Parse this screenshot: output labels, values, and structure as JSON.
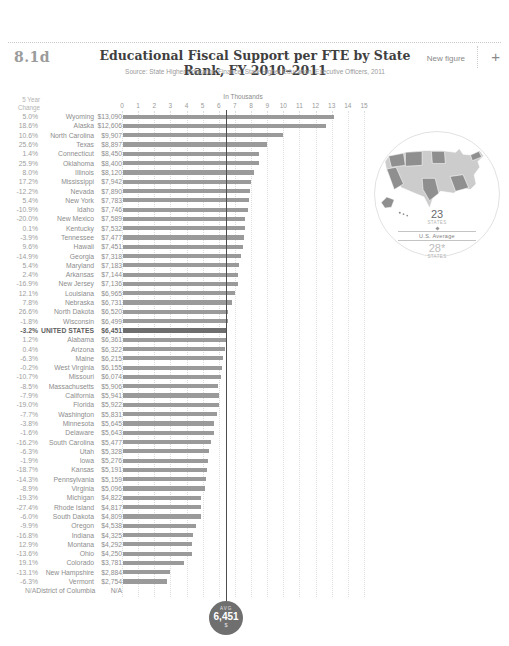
{
  "header": {
    "figure_number": "8.1d",
    "title": "Educational Fiscal Support per FTE by State Rank, FY 2010–2011",
    "source": "Source: State Higher Education Finance, State Higher Education, Executive Officers, 2011",
    "new_figure_label": "New figure",
    "add_icon": "+"
  },
  "left_column_header_line1": "5 Year",
  "left_column_header_line2": "Change",
  "axis": {
    "title": "In Thousands",
    "ticks": [
      0,
      1,
      2,
      3,
      4,
      5,
      6,
      7,
      8,
      9,
      10,
      11,
      12,
      13,
      14,
      15
    ]
  },
  "rows": [
    {
      "pct": "5.0%",
      "state": "Wyoming",
      "value": "$13,090"
    },
    {
      "pct": "18.6%",
      "state": "Alaska",
      "value": "$12,606"
    },
    {
      "pct": "10.6%",
      "state": "North Carolina",
      "value": "$9,907"
    },
    {
      "pct": "25.6%",
      "state": "Texas",
      "value": "$8,897"
    },
    {
      "pct": "1.4%",
      "state": "Connecticut",
      "value": "$8,450"
    },
    {
      "pct": "25.9%",
      "state": "Oklahoma",
      "value": "$8,400"
    },
    {
      "pct": "8.0%",
      "state": "Illinois",
      "value": "$8,120"
    },
    {
      "pct": "17.2%",
      "state": "Mississippi",
      "value": "$7,942"
    },
    {
      "pct": "-12.2%",
      "state": "Nevada",
      "value": "$7,890"
    },
    {
      "pct": "5.4%",
      "state": "New York",
      "value": "$7,783"
    },
    {
      "pct": "-10.9%",
      "state": "Idaho",
      "value": "$7,746"
    },
    {
      "pct": "-20.0%",
      "state": "New Mexico",
      "value": "$7,589"
    },
    {
      "pct": "0.1%",
      "state": "Kentucky",
      "value": "$7,532"
    },
    {
      "pct": "-3.9%",
      "state": "Tennessee",
      "value": "$7,477"
    },
    {
      "pct": "9.6%",
      "state": "Hawaii",
      "value": "$7,451"
    },
    {
      "pct": "-14.9%",
      "state": "Georgia",
      "value": "$7,318"
    },
    {
      "pct": "5.4%",
      "state": "Maryland",
      "value": "$7,183"
    },
    {
      "pct": "2.4%",
      "state": "Arkansas",
      "value": "$7,144"
    },
    {
      "pct": "-16.9%",
      "state": "New Jersey",
      "value": "$7,136"
    },
    {
      "pct": "12.1%",
      "state": "Louisiana",
      "value": "$6,965"
    },
    {
      "pct": "7.8%",
      "state": "Nebraska",
      "value": "$6,731"
    },
    {
      "pct": "26.6%",
      "state": "North Dakota",
      "value": "$6,520"
    },
    {
      "pct": "-1.8%",
      "state": "Wisconsin",
      "value": "$6,499"
    },
    {
      "pct": "-3.2%",
      "state": "UNITED STATES",
      "value": "$6,451"
    },
    {
      "pct": "1.2%",
      "state": "Alabama",
      "value": "$6,361"
    },
    {
      "pct": "0.4%",
      "state": "Arizona",
      "value": "$6,322"
    },
    {
      "pct": "-6.3%",
      "state": "Maine",
      "value": "$6,215"
    },
    {
      "pct": "-0.2%",
      "state": "West Virginia",
      "value": "$6,155"
    },
    {
      "pct": "-10.7%",
      "state": "Missouri",
      "value": "$6,074"
    },
    {
      "pct": "-8.5%",
      "state": "Massachusetts",
      "value": "$5,906"
    },
    {
      "pct": "-7.9%",
      "state": "California",
      "value": "$5,941"
    },
    {
      "pct": "-19.0%",
      "state": "Florida",
      "value": "$5,922"
    },
    {
      "pct": "-7.7%",
      "state": "Washington",
      "value": "$5,831"
    },
    {
      "pct": "-3.8%",
      "state": "Minnesota",
      "value": "$5,645"
    },
    {
      "pct": "-1.6%",
      "state": "Delaware",
      "value": "$5,643"
    },
    {
      "pct": "-16.2%",
      "state": "South Carolina",
      "value": "$5,477"
    },
    {
      "pct": "-6.3%",
      "state": "Utah",
      "value": "$5,328"
    },
    {
      "pct": "-1.9%",
      "state": "Iowa",
      "value": "$5,276"
    },
    {
      "pct": "-18.7%",
      "state": "Kansas",
      "value": "$5,191"
    },
    {
      "pct": "-14.3%",
      "state": "Pennsylvania",
      "value": "$5,159"
    },
    {
      "pct": "-8.9%",
      "state": "Virginia",
      "value": "$5,096"
    },
    {
      "pct": "-19.3%",
      "state": "Michigan",
      "value": "$4,822"
    },
    {
      "pct": "-27.4%",
      "state": "Rhode Island",
      "value": "$4,817"
    },
    {
      "pct": "-6.0%",
      "state": "South Dakota",
      "value": "$4,809"
    },
    {
      "pct": "-9.9%",
      "state": "Oregon",
      "value": "$4,538"
    },
    {
      "pct": "-16.8%",
      "state": "Indiana",
      "value": "$4,325"
    },
    {
      "pct": "12.9%",
      "state": "Montana",
      "value": "$4,292"
    },
    {
      "pct": "-13.6%",
      "state": "Ohio",
      "value": "$4,250"
    },
    {
      "pct": "19.1%",
      "state": "Colorado",
      "value": "$3,781"
    },
    {
      "pct": "-13.1%",
      "state": "New Hampshire",
      "value": "$2,884"
    },
    {
      "pct": "-6.3%",
      "state": "Vermont",
      "value": "$2,754"
    },
    {
      "pct": "N/A",
      "state": "District of Columbia",
      "value": "N/A"
    }
  ],
  "us_average": {
    "value": 6451,
    "badge_label": "AVG",
    "badge_value": "6,451",
    "badge_unit": "$"
  },
  "map_panel": {
    "above_count": "23",
    "above_label": "States",
    "divider_label": "U.S. Average",
    "below_count": "28*",
    "below_label": "States"
  },
  "colors": {
    "bar": "#9a9a9a",
    "bar-emphasis": "#6e6e6e",
    "avg-line": "#4d4d4d",
    "badge-bg": "#6f6f6f",
    "map-dark": "#8f8f8f",
    "map-light": "#cccccc"
  },
  "chart_data": {
    "type": "bar",
    "orientation": "horizontal",
    "title": "Educational Fiscal Support per FTE by State Rank, FY 2010–2011",
    "xlabel": "In Thousands",
    "ylabel": "State",
    "xlim_thousands": [
      0,
      15
    ],
    "grid": "dotted-vertical",
    "emphasis_row": "UNITED STATES",
    "categories": [
      "Wyoming",
      "Alaska",
      "North Carolina",
      "Texas",
      "Connecticut",
      "Oklahoma",
      "Illinois",
      "Mississippi",
      "Nevada",
      "New York",
      "Idaho",
      "New Mexico",
      "Kentucky",
      "Tennessee",
      "Hawaii",
      "Georgia",
      "Maryland",
      "Arkansas",
      "New Jersey",
      "Louisiana",
      "Nebraska",
      "North Dakota",
      "Wisconsin",
      "UNITED STATES",
      "Alabama",
      "Arizona",
      "Maine",
      "West Virginia",
      "Missouri",
      "Massachusetts",
      "California",
      "Florida",
      "Washington",
      "Minnesota",
      "Delaware",
      "South Carolina",
      "Utah",
      "Iowa",
      "Kansas",
      "Pennsylvania",
      "Virginia",
      "Michigan",
      "Rhode Island",
      "South Dakota",
      "Oregon",
      "Indiana",
      "Montana",
      "Ohio",
      "Colorado",
      "New Hampshire",
      "Vermont",
      "District of Columbia"
    ],
    "values": [
      13090,
      12606,
      9907,
      8897,
      8450,
      8400,
      8120,
      7942,
      7890,
      7783,
      7746,
      7589,
      7532,
      7477,
      7451,
      7318,
      7183,
      7144,
      7136,
      6965,
      6731,
      6520,
      6499,
      6451,
      6361,
      6322,
      6215,
      6155,
      6074,
      5906,
      5941,
      5922,
      5831,
      5645,
      5643,
      5477,
      5328,
      5276,
      5191,
      5159,
      5096,
      4822,
      4817,
      4809,
      4538,
      4325,
      4292,
      4250,
      3781,
      2884,
      2754,
      null
    ],
    "pct_change_5yr": [
      "5.0%",
      "18.6%",
      "10.6%",
      "25.6%",
      "1.4%",
      "25.9%",
      "8.0%",
      "17.2%",
      "-12.2%",
      "5.4%",
      "-10.9%",
      "-20.0%",
      "0.1%",
      "-3.9%",
      "9.6%",
      "-14.9%",
      "5.4%",
      "2.4%",
      "-16.9%",
      "12.1%",
      "7.8%",
      "26.6%",
      "-1.8%",
      "-3.2%",
      "1.2%",
      "0.4%",
      "-6.3%",
      "-0.2%",
      "-10.7%",
      "-8.5%",
      "-7.9%",
      "-19.0%",
      "-7.7%",
      "-3.8%",
      "-1.6%",
      "-16.2%",
      "-6.3%",
      "-1.9%",
      "-18.7%",
      "-14.3%",
      "-8.9%",
      "-19.3%",
      "-27.4%",
      "-6.0%",
      "-9.9%",
      "-16.8%",
      "12.9%",
      "-13.6%",
      "19.1%",
      "-13.1%",
      "-6.3%",
      "N/A"
    ],
    "us_average": 6451,
    "states_above_average": 23,
    "states_below_average": 28
  }
}
